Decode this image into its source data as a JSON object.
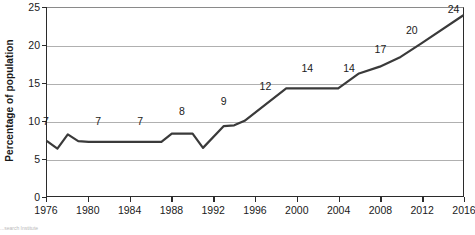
{
  "chart_data": {
    "type": "line",
    "title": "",
    "xlabel": "",
    "ylabel": "Percentage of population",
    "xlim": [
      1976,
      2016
    ],
    "ylim": [
      0,
      25
    ],
    "grid": true,
    "legend": null,
    "x_ticks": [
      1976,
      1980,
      1984,
      1988,
      1992,
      1996,
      2000,
      2004,
      2008,
      2012,
      2016
    ],
    "y_ticks": [
      0,
      5,
      10,
      15,
      20,
      25
    ],
    "series": [
      {
        "name": "Percentage of population",
        "color": "#3a3a3a",
        "x": [
          1976,
          1977,
          1978,
          1979,
          1980,
          1984,
          1987,
          1988,
          1990,
          1991,
          1993,
          1994,
          1995,
          1999,
          2004,
          2006,
          2008,
          2010,
          2012,
          2016
        ],
        "y": [
          7.3,
          6.3,
          8.2,
          7.3,
          7.2,
          7.2,
          7.2,
          8.3,
          8.3,
          6.4,
          9.3,
          9.4,
          10.0,
          14.3,
          14.3,
          16.3,
          17.2,
          18.5,
          20.3,
          24.0
        ]
      }
    ],
    "annotations": [
      {
        "text": "7",
        "x": 1976,
        "y": 10.0
      },
      {
        "text": "7",
        "x": 1981,
        "y": 10.0
      },
      {
        "text": "7",
        "x": 1985,
        "y": 10.0
      },
      {
        "text": "8",
        "x": 1989,
        "y": 11.3
      },
      {
        "text": "9",
        "x": 1993,
        "y": 12.6
      },
      {
        "text": "12",
        "x": 1997,
        "y": 14.6
      },
      {
        "text": "14",
        "x": 2001,
        "y": 17.0
      },
      {
        "text": "14",
        "x": 2005,
        "y": 17.0
      },
      {
        "text": "17",
        "x": 2008,
        "y": 19.5
      },
      {
        "text": "20",
        "x": 2011,
        "y": 22.0
      },
      {
        "text": "24",
        "x": 2015,
        "y": 24.7
      }
    ]
  },
  "footer": {
    "source": "...search Institute"
  }
}
